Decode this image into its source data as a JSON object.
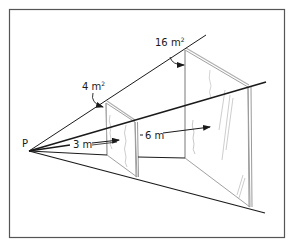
{
  "figure": {
    "point_label": "P",
    "small_area_label": "4 m",
    "small_area_exp": "2",
    "large_area_label": "16 m",
    "large_area_exp": "2",
    "near_distance_label": "3 m",
    "far_distance_label": "6 m"
  },
  "colors": {
    "line": "#1a1a1a",
    "panel_edge": "#9a9a9a",
    "frame": "#555555",
    "background": "#ffffff"
  }
}
